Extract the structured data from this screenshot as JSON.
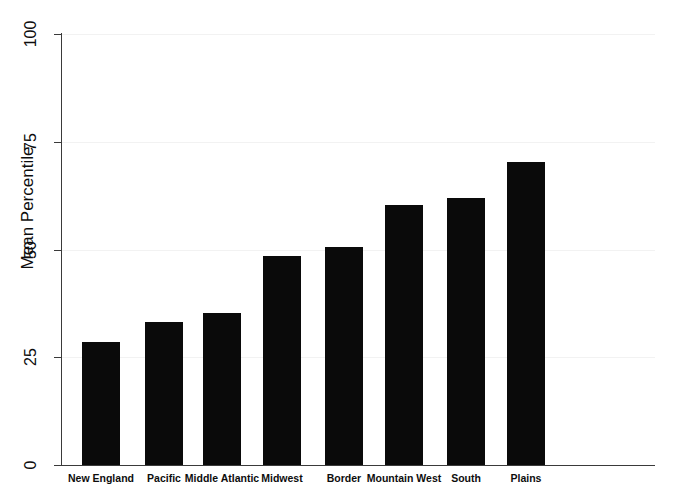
{
  "chart_data": {
    "type": "bar",
    "title": "",
    "xlabel": "",
    "ylabel": "Mean Percentile",
    "ylim": [
      0,
      100
    ],
    "yticks": [
      0,
      25,
      50,
      75,
      100
    ],
    "ytick_labels": [
      "0",
      "25",
      "50",
      "75",
      "100"
    ],
    "grid": true,
    "legend": "none",
    "bar_color": "#0a0a0a",
    "categories": [
      "New England",
      "Pacific",
      "Middle Atlantic",
      "Midwest",
      "Border",
      "Mountain West",
      "South",
      "Plains"
    ],
    "values": [
      28.5,
      33.2,
      35.3,
      48.5,
      50.6,
      60.3,
      62.0,
      70.3
    ]
  }
}
